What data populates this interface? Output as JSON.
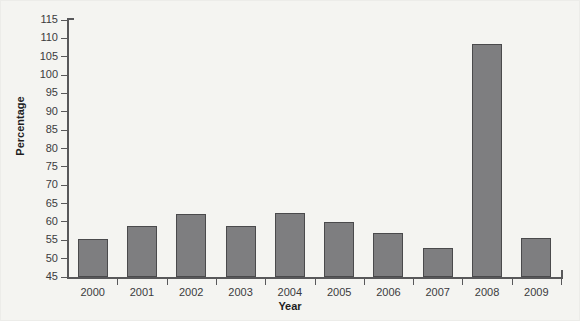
{
  "chart_data": {
    "type": "bar",
    "title": "",
    "subtitle": "",
    "xlabel": "Year",
    "ylabel": "Percentage",
    "categories": [
      "2000",
      "2001",
      "2002",
      "2003",
      "2004",
      "2005",
      "2006",
      "2007",
      "2008",
      "2009"
    ],
    "values": [
      55.4,
      59.0,
      62.2,
      59.0,
      62.5,
      60.0,
      57.0,
      53.0,
      108.5,
      55.5
    ],
    "ylim": [
      45,
      115
    ],
    "y_tick_step": 5,
    "y_ticks": [
      "45",
      "50",
      "55",
      "60",
      "65",
      "70",
      "75",
      "80",
      "85",
      "90",
      "95",
      "100",
      "105",
      "110",
      "115"
    ],
    "grid": false,
    "legend": null,
    "legend_position": "none",
    "bar_color": "#7e7e80",
    "bar_border_color": "#4a4a4c",
    "axis_color": "#58585a",
    "background_color": "#f4f4f1",
    "annotations": []
  }
}
